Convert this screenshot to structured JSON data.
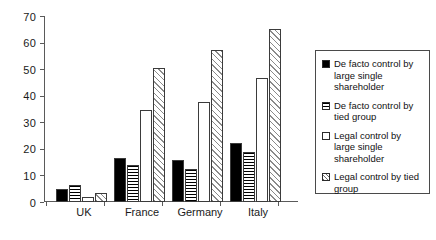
{
  "chart_data": {
    "type": "bar",
    "title": "",
    "xlabel": "",
    "ylabel": "",
    "ylim": [
      0,
      70
    ],
    "yticks": [
      0,
      10,
      20,
      30,
      40,
      50,
      60,
      70
    ],
    "ytick_labels": [
      "0",
      "10",
      "20",
      "30",
      "40",
      "50",
      "60",
      "70"
    ],
    "grid": false,
    "legend_position": "right",
    "categories": [
      "UK",
      "France",
      "Germany",
      "Italy"
    ],
    "series": [
      {
        "name": "De facto control by large single shareholder",
        "fill": "solid-black",
        "color": "#000000",
        "values": [
          5.0,
          16.5,
          15.7,
          22.2
        ]
      },
      {
        "name": "De facto control by tied group",
        "fill": "horizontal-stripes",
        "color": "#000000",
        "values": [
          6.3,
          13.8,
          12.3,
          18.8
        ]
      },
      {
        "name": "Legal control by large single shareholder",
        "fill": "white",
        "color": "#ffffff",
        "values": [
          2.0,
          34.7,
          37.6,
          46.8
        ]
      },
      {
        "name": "Legal control by tied group",
        "fill": "diagonal-hatch",
        "color": "#8a8a8a",
        "values": [
          3.3,
          50.3,
          57.2,
          65.0
        ]
      }
    ]
  },
  "legend": {
    "items": [
      {
        "label": "De facto control by large single shareholder"
      },
      {
        "label": "De facto control by tied group"
      },
      {
        "label": "Legal control by large single shareholder"
      },
      {
        "label": "Legal control by tied group"
      }
    ]
  }
}
